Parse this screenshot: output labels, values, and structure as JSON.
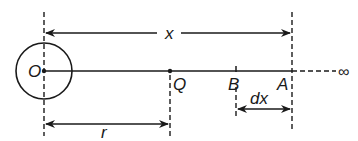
{
  "diagram": {
    "type": "physics-potential-line-diagram",
    "labels": {
      "origin": "O",
      "point_q": "Q",
      "point_b": "B",
      "point_a": "A",
      "distance_x": "x",
      "distance_r": "r",
      "distance_dx": "dx",
      "infinity": "∞"
    },
    "colors": {
      "stroke": "#1a1a1a",
      "background": "#ffffff"
    }
  }
}
